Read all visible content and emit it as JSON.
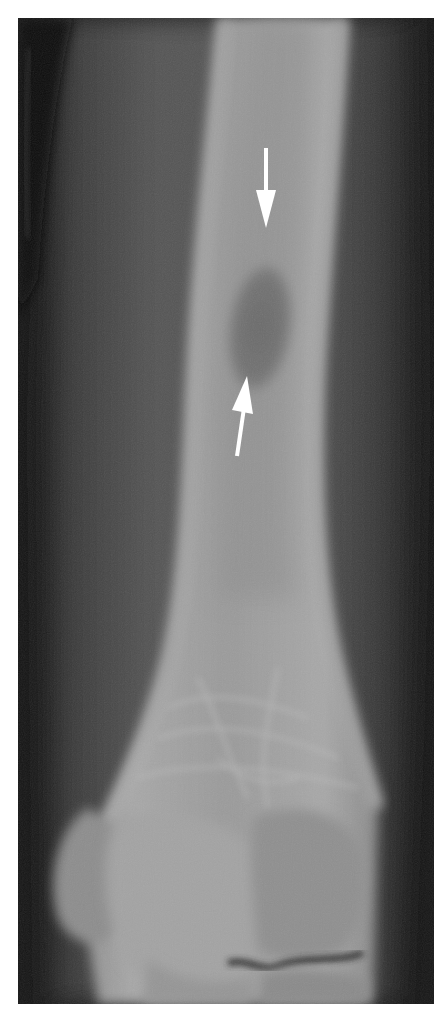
{
  "figure": {
    "background_color": "#ffffff",
    "film_tone_dark": "#1a1a1a",
    "soft_tissue_tone": "#4a4a4a",
    "bone_tone": "#9a9a9a",
    "lesion_tone": "#6e6e6e",
    "annotations": [
      {
        "type": "arrow",
        "direction": "down",
        "color": "#ffffff",
        "target": "lesion-superior-margin"
      },
      {
        "type": "arrow",
        "direction": "up",
        "color": "#ffffff",
        "target": "lesion-inferior-margin"
      }
    ]
  }
}
